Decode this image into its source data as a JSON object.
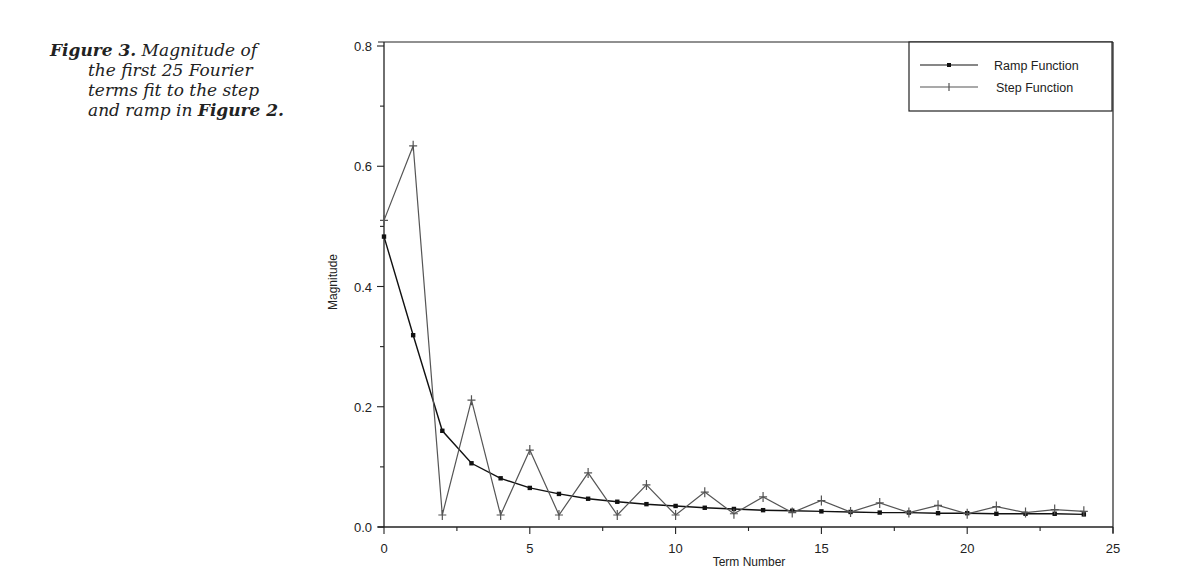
{
  "caption": {
    "figure_label": "Figure 3.",
    "line1_rest": " Magnitude of",
    "line2": "the first 25 Fourier",
    "line3": "terms fit to the step",
    "line4_pre": "and ramp in ",
    "line4_ref": "Figure 2."
  },
  "chart_data": {
    "type": "line",
    "title": "",
    "xlabel": "Term Number",
    "ylabel": "Magnitude",
    "xlim": [
      0,
      25
    ],
    "ylim": [
      0,
      0.8
    ],
    "x_ticks": [
      "0",
      "5",
      "10",
      "15",
      "20",
      "25"
    ],
    "y_ticks": [
      "0.0",
      "0.2",
      "0.4",
      "0.6",
      "0.8"
    ],
    "grid": false,
    "legend_position": "top-right",
    "x": [
      0,
      1,
      2,
      3,
      4,
      5,
      6,
      7,
      8,
      9,
      10,
      11,
      12,
      13,
      14,
      15,
      16,
      17,
      18,
      19,
      20,
      21,
      22,
      23,
      24
    ],
    "series": [
      {
        "name": "Ramp Function",
        "color": "#111111",
        "marker": "square",
        "values": [
          0.483,
          0.319,
          0.16,
          0.106,
          0.081,
          0.065,
          0.055,
          0.047,
          0.042,
          0.038,
          0.035,
          0.032,
          0.03,
          0.028,
          0.027,
          0.026,
          0.025,
          0.024,
          0.024,
          0.023,
          0.023,
          0.022,
          0.022,
          0.022,
          0.021
        ]
      },
      {
        "name": "Step Function",
        "color": "#555555",
        "marker": "plus",
        "values": [
          0.51,
          0.634,
          0.02,
          0.211,
          0.02,
          0.128,
          0.02,
          0.09,
          0.02,
          0.07,
          0.02,
          0.058,
          0.022,
          0.05,
          0.024,
          0.044,
          0.025,
          0.04,
          0.024,
          0.036,
          0.022,
          0.034,
          0.024,
          0.029,
          0.026
        ]
      }
    ]
  }
}
